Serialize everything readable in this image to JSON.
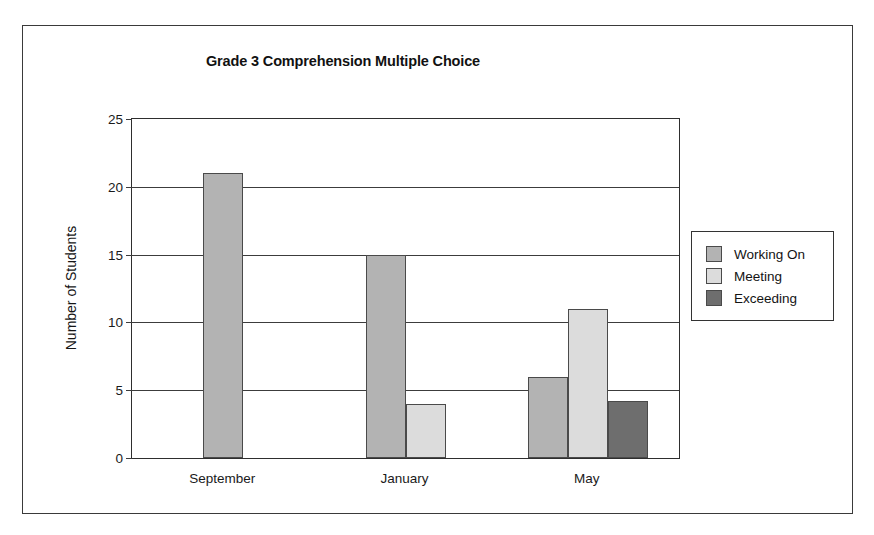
{
  "chart_data": {
    "type": "bar",
    "title": "Grade 3 Comprehension Multiple Choice",
    "xlabel": "",
    "ylabel": "Number of Students",
    "categories": [
      "September",
      "January",
      "May"
    ],
    "series": [
      {
        "name": "Working On",
        "values": [
          21,
          15,
          6
        ],
        "color": "#b3b3b3"
      },
      {
        "name": "Meeting",
        "values": [
          0,
          4,
          11
        ],
        "color": "#dcdcdc"
      },
      {
        "name": "Exceeding",
        "values": [
          0,
          0,
          4.2
        ],
        "color": "#6e6e6e"
      }
    ],
    "yticks": [
      0,
      5,
      10,
      15,
      20,
      25
    ],
    "ylim": [
      0,
      25
    ],
    "grid": true,
    "legend_position": "right-outside"
  }
}
